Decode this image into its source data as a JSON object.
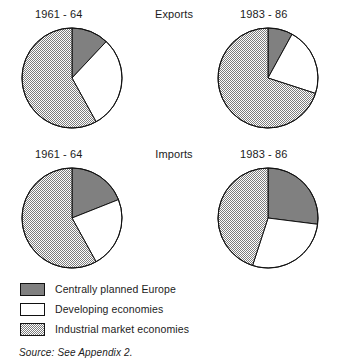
{
  "clipped_text_above": "g",
  "rows": [
    {
      "title": "Exports",
      "left_year": "1961 - 64",
      "right_year": "1983 - 86"
    },
    {
      "title": "Imports",
      "left_year": "1961 - 64",
      "right_year": "1983 - 86"
    }
  ],
  "legend": {
    "items": [
      {
        "label": "Centrally planned Europe",
        "fill": "solid-gray",
        "color": "#808080"
      },
      {
        "label": "Developing economies",
        "fill": "white",
        "color": "#ffffff"
      },
      {
        "label": "Industrial market economies",
        "fill": "hatched",
        "color": "#c9c9c9"
      }
    ]
  },
  "source": "Source:  See Appendix 2.",
  "chart_data": {
    "type": "pie",
    "title": "",
    "legend_position": "bottom-left",
    "series_labels": [
      "Centrally planned Europe",
      "Developing economies",
      "Industrial market economies"
    ],
    "colors": [
      "#808080",
      "#ffffff",
      "#c9c9c9"
    ],
    "start_angle_deg": 0,
    "direction": "clockwise",
    "charts": [
      {
        "row": "Exports",
        "period": "1961 - 64",
        "categories": [
          "Centrally planned Europe",
          "Developing economies",
          "Industrial market economies"
        ],
        "values": [
          12,
          30,
          58
        ],
        "unit": "percent"
      },
      {
        "row": "Exports",
        "period": "1983 - 86",
        "categories": [
          "Centrally planned Europe",
          "Developing economies",
          "Industrial market economies"
        ],
        "values": [
          8,
          22,
          70
        ],
        "unit": "percent"
      },
      {
        "row": "Imports",
        "period": "1961 - 64",
        "categories": [
          "Centrally planned Europe",
          "Developing economies",
          "Industrial market economies"
        ],
        "values": [
          19,
          23,
          58
        ],
        "unit": "percent"
      },
      {
        "row": "Imports",
        "period": "1983 - 86",
        "categories": [
          "Centrally planned Europe",
          "Developing economies",
          "Industrial market economies"
        ],
        "values": [
          27,
          28,
          45
        ],
        "unit": "percent"
      }
    ]
  }
}
